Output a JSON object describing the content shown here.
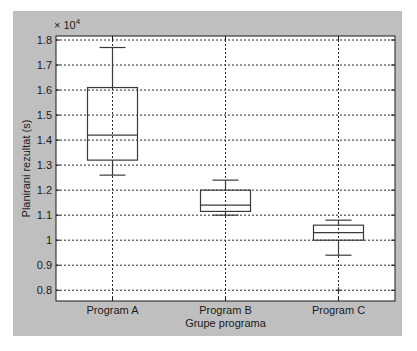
{
  "chart_data": {
    "type": "boxplot",
    "title": "",
    "xlabel": "Grupe programa",
    "ylabel": "Planirani rezultat (s)",
    "y_exponent_label": "× 10",
    "y_exponent_power": "4",
    "ylim": [
      0.757,
      1.816
    ],
    "yticks": [
      0.8,
      0.9,
      1.0,
      1.1,
      1.2,
      1.3,
      1.4,
      1.5,
      1.6,
      1.7,
      1.8
    ],
    "ytick_labels": [
      "0.8",
      "0.9",
      "1",
      "1.1",
      "1.2",
      "1.3",
      "1.4",
      "1.5",
      "1.6",
      "1.7",
      "1.8"
    ],
    "grid": true,
    "categories": [
      "Program A",
      "Program B",
      "Program C"
    ],
    "series": [
      {
        "name": "Program A",
        "lower_whisker": 1.26,
        "q1": 1.32,
        "median": 1.42,
        "q3": 1.61,
        "upper_whisker": 1.77,
        "outliers": []
      },
      {
        "name": "Program B",
        "lower_whisker": 1.1,
        "q1": 1.115,
        "median": 1.14,
        "q3": 1.2,
        "upper_whisker": 1.24,
        "outliers": []
      },
      {
        "name": "Program C",
        "lower_whisker": 0.94,
        "q1": 1.0,
        "median": 1.03,
        "q3": 1.06,
        "upper_whisker": 1.08,
        "outliers": [
          0.8
        ]
      }
    ],
    "colors": {
      "box": "#3a3a3a",
      "grid": "#2a2a2a",
      "panel_background": "#bfbfbf",
      "plot_background": "#ffffff"
    }
  }
}
